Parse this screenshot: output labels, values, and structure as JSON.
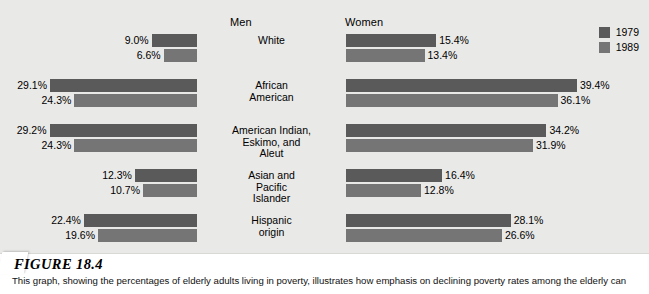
{
  "figure": {
    "number_label": "FIGURE 18.4",
    "caption": "This graph, showing the percentages of elderly adults living in poverty, illustrates how emphasis on declining poverty rates among the elderly can"
  },
  "colors": {
    "series_1979": "#5a5a5a",
    "series_1989": "#757575",
    "panel_background": "#e9e9e7",
    "caption_background": "#ffffff",
    "text": "#000000"
  },
  "headers": {
    "men": "Men",
    "women": "Women"
  },
  "legend": {
    "position": "top-right",
    "items": [
      {
        "label": "1979",
        "color": "#5a5a5a"
      },
      {
        "label": "1989",
        "color": "#757575"
      }
    ]
  },
  "chart_data": {
    "type": "bar",
    "orientation": "horizontal-bidirectional",
    "title": "FIGURE 18.4",
    "subtitle": "Percentages of elderly adults living in poverty",
    "xlabel": "",
    "ylabel": "",
    "grid": false,
    "legend_position": "top-right",
    "value_suffix": "%",
    "axis_note": "Men bars extend leftward from a shared right edge; Women bars extend rightward from a shared left edge.",
    "px_per_percent_men": 5.05,
    "px_per_percent_women": 5.86,
    "categories": [
      "White",
      "African American",
      "American Indian, Eskimo, and Aleut",
      "Asian and Pacific Islander",
      "Hispanic origin"
    ],
    "category_lines": [
      [
        "White"
      ],
      [
        "African",
        "American"
      ],
      [
        "American Indian,",
        "Eskimo, and",
        "Aleut"
      ],
      [
        "Asian and",
        "Pacific",
        "Islander"
      ],
      [
        "Hispanic",
        "origin"
      ]
    ],
    "series": [
      {
        "name": "1979",
        "color": "#5a5a5a",
        "men": [
          9.0,
          29.1,
          29.2,
          12.3,
          22.4
        ],
        "women": [
          15.4,
          39.4,
          34.2,
          16.4,
          28.1
        ]
      },
      {
        "name": "1989",
        "color": "#757575",
        "men": [
          6.6,
          24.3,
          24.3,
          10.7,
          19.6
        ],
        "women": [
          13.4,
          36.1,
          31.9,
          12.8,
          26.6
        ]
      }
    ],
    "labels": {
      "men_1979": [
        "9.0%",
        "29.1%",
        "29.2%",
        "12.3%",
        "22.4%"
      ],
      "men_1989": [
        "6.6%",
        "24.3%",
        "24.3%",
        "10.7%",
        "19.6%"
      ],
      "women_1979": [
        "15.4%",
        "39.4%",
        "34.2%",
        "16.4%",
        "28.1%"
      ],
      "women_1989": [
        "13.4%",
        "36.1%",
        "31.9%",
        "12.8%",
        "26.6%"
      ]
    }
  }
}
